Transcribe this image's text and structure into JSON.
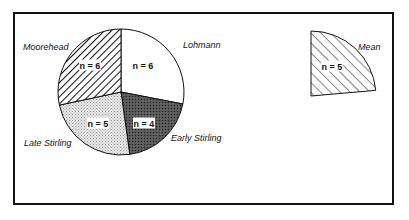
{
  "chart_data": [
    {
      "type": "pie",
      "title": "",
      "center": [
        121,
        92
      ],
      "radius": 63,
      "slices": [
        {
          "label": "Lohmann",
          "n": 6,
          "n_text": "n = 6",
          "start_deg": 0,
          "end_deg": 101,
          "fill": "white",
          "label_pos": [
            183,
            48
          ],
          "label_anchor": "start",
          "n_pos": [
            143,
            66
          ]
        },
        {
          "label": "Early Stirling",
          "n": 4,
          "n_text": "n = 4",
          "start_deg": 101,
          "end_deg": 172,
          "fill": "dark-stipple",
          "label_pos": [
            171,
            141
          ],
          "label_anchor": "start",
          "n_pos": [
            144,
            124
          ]
        },
        {
          "label": "Late Stirling",
          "n": 5,
          "n_text": "n = 5",
          "start_deg": 172,
          "end_deg": 258,
          "fill": "light-stipple",
          "label_pos": [
            24,
            146
          ],
          "label_anchor": "start",
          "n_pos": [
            98,
            124
          ]
        },
        {
          "label": "Moorehead",
          "n": 6,
          "n_text": "n = 6",
          "start_deg": 258,
          "end_deg": 360,
          "fill": "diagonal-hatch",
          "label_pos": [
            23,
            50
          ],
          "label_anchor": "start",
          "n_pos": [
            90,
            66
          ]
        }
      ]
    },
    {
      "type": "pie",
      "title": "",
      "center": [
        311,
        96
      ],
      "radius": 65,
      "slices": [
        {
          "label": "Mean",
          "n": 5,
          "n_text": "n = 5",
          "start_deg": 0,
          "end_deg": 85,
          "fill": "back-diagonal-hatch",
          "label_pos": [
            358,
            50
          ],
          "label_anchor": "start",
          "n_pos": [
            332,
            67
          ]
        }
      ]
    }
  ],
  "frame": {
    "x": 14,
    "y": 13,
    "width": 379,
    "height": 191
  },
  "colors": {
    "ink": "#111111",
    "light_stipple": "#d9d9d9",
    "dark_stipple": "#4a4a4a",
    "background": "#ffffff"
  }
}
